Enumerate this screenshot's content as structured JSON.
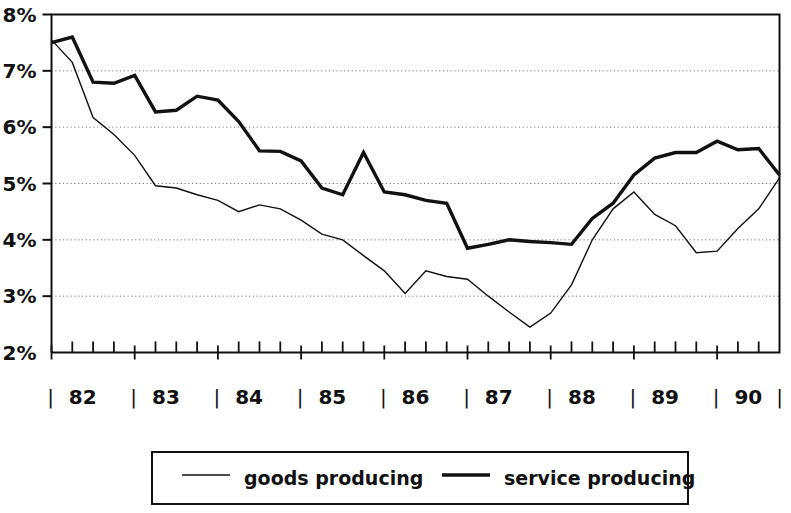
{
  "chart_data": {
    "type": "line",
    "title": "",
    "xlabel": "",
    "ylabel": "",
    "ylim": [
      2,
      8
    ],
    "ytick_labels": [
      "2%",
      "3%",
      "4%",
      "5%",
      "6%",
      "7%",
      "8%"
    ],
    "ytick_values": [
      2,
      3,
      4,
      5,
      6,
      7,
      8
    ],
    "gridlines": [
      3,
      4,
      5,
      6,
      7
    ],
    "grid": true,
    "grid_style": "dotted",
    "xlim": [
      1982.0,
      1990.75
    ],
    "xtick_labels": [
      "82",
      "83",
      "84",
      "85",
      "86",
      "87",
      "88",
      "89",
      "90"
    ],
    "xtick_values": [
      1982,
      1983,
      1984,
      1985,
      1986,
      1987,
      1988,
      1989,
      1990
    ],
    "x_separator_glyph": "|",
    "x_frequency": "quarterly",
    "legend_position": "below-center",
    "x": [
      1982.0,
      1982.25,
      1982.5,
      1982.75,
      1983.0,
      1983.25,
      1983.5,
      1983.75,
      1984.0,
      1984.25,
      1984.5,
      1984.75,
      1985.0,
      1985.25,
      1985.5,
      1985.75,
      1986.0,
      1986.25,
      1986.5,
      1986.75,
      1987.0,
      1987.25,
      1987.5,
      1987.75,
      1988.0,
      1988.25,
      1988.5,
      1988.75,
      1989.0,
      1989.25,
      1989.5,
      1989.75,
      1990.0,
      1990.25,
      1990.5,
      1990.75
    ],
    "series": [
      {
        "name": "goods producing",
        "line_width": 1.4,
        "color": "#111111",
        "values": [
          7.55,
          7.15,
          6.17,
          5.87,
          5.5,
          4.96,
          4.92,
          4.8,
          4.7,
          4.5,
          4.62,
          4.55,
          4.35,
          4.1,
          4.0,
          3.72,
          3.45,
          3.05,
          3.45,
          3.35,
          3.3,
          3.0,
          2.72,
          2.45,
          2.7,
          3.2,
          4.0,
          4.55,
          4.85,
          4.45,
          4.25,
          3.77,
          3.8,
          4.2,
          4.55,
          5.1
        ]
      },
      {
        "name": "service producing",
        "line_width": 3.4,
        "color": "#111111",
        "values": [
          7.5,
          7.6,
          6.8,
          6.78,
          6.92,
          6.27,
          6.3,
          6.55,
          6.48,
          6.1,
          5.58,
          5.57,
          5.4,
          4.92,
          4.8,
          5.55,
          4.85,
          4.8,
          4.7,
          4.65,
          3.85,
          3.92,
          4.0,
          3.97,
          3.95,
          3.92,
          4.38,
          4.65,
          5.15,
          5.45,
          5.55,
          5.55,
          5.75,
          5.6,
          5.62,
          5.15
        ]
      }
    ]
  },
  "legend": {
    "items": [
      {
        "label": "goods producing",
        "swatch": "thin-line-swatch"
      },
      {
        "label": "service producing",
        "swatch": "thick-line-swatch"
      }
    ]
  }
}
